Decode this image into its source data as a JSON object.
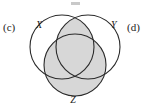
{
  "figure": {
    "type": "venn-diagram",
    "caption_labels": {
      "left": "(c)",
      "right": "(d)"
    },
    "sets": [
      {
        "id": "X",
        "label": "X",
        "position": "top-left",
        "shaded": false,
        "cx": 62,
        "cy": 47,
        "r": 32
      },
      {
        "id": "Y",
        "label": "Y",
        "position": "top-right",
        "shaded": false,
        "cx": 88,
        "cy": 47,
        "r": 32
      },
      {
        "id": "Z",
        "label": "Z",
        "position": "bottom",
        "shaded": true,
        "cx": 75,
        "cy": 65,
        "r": 31
      }
    ],
    "shaded_regions": [
      "Z",
      "X-intersect-Y"
    ],
    "colors": {
      "shade": "#d7d7d7",
      "stroke": "#2a2a2a",
      "background": "#ffffff",
      "text": "#1b1b1b"
    },
    "stroke_width": 1.1
  }
}
